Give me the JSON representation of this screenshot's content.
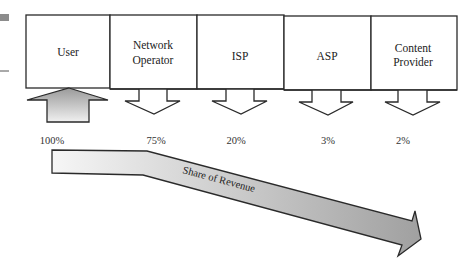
{
  "diagram": {
    "stakeholders": [
      {
        "label_lines": [
          "User"
        ],
        "share": "100%",
        "flow": "in"
      },
      {
        "label_lines": [
          "Network",
          "Operator"
        ],
        "share": "75%",
        "flow": "out"
      },
      {
        "label_lines": [
          "ISP"
        ],
        "share": "20%",
        "flow": "out"
      },
      {
        "label_lines": [
          "ASP"
        ],
        "share": "3%",
        "flow": "out"
      },
      {
        "label_lines": [
          "Content",
          "Provider"
        ],
        "share": "2%",
        "flow": "out"
      }
    ],
    "revenue_arrow_label": "Share of Revenue",
    "colors": {
      "stroke": "#2a2a2a",
      "fill_light": "#f4f4f4",
      "fill_dark": "#a8a8a8",
      "left_bar": "#8c8c8c"
    }
  }
}
